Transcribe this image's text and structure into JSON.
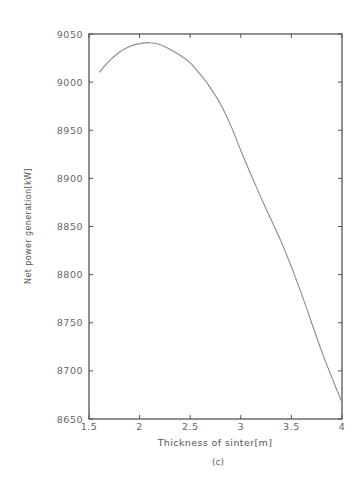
{
  "chart_data": {
    "type": "line",
    "title": "",
    "caption": "(c)",
    "xlabel": "Thickness of sinter[m]",
    "ylabel": "Net power generation[kW]",
    "xlim": [
      1.5,
      4
    ],
    "ylim": [
      8650,
      9050
    ],
    "xticks": [
      1.5,
      2,
      2.5,
      3,
      3.5,
      4
    ],
    "xtick_labels": [
      "1.5",
      "2",
      "2.5",
      "3",
      "3.5",
      "4"
    ],
    "yticks": [
      8650,
      8700,
      8750,
      8800,
      8850,
      8900,
      8950,
      9000,
      9050
    ],
    "ytick_labels": [
      "8650",
      "8700",
      "8750",
      "8800",
      "8850",
      "8900",
      "8950",
      "9000",
      "9050"
    ],
    "grid": false,
    "legend": null,
    "series": [
      {
        "name": "Net power generation",
        "x": [
          1.6,
          1.7,
          1.8,
          1.9,
          2.0,
          2.1,
          2.2,
          2.3,
          2.4,
          2.5,
          2.6,
          2.7,
          2.8,
          2.9,
          3.0,
          3.1,
          3.2,
          3.3,
          3.4,
          3.5,
          3.6,
          3.7,
          3.8,
          3.9,
          4.0
        ],
        "y": [
          9010,
          9022,
          9031,
          9037,
          9040,
          9041,
          9039,
          9034,
          9028,
          9020,
          9008,
          8994,
          8977,
          8955,
          8929,
          8904,
          8880,
          8857,
          8834,
          8808,
          8780,
          8750,
          8720,
          8693,
          8667
        ]
      }
    ]
  }
}
